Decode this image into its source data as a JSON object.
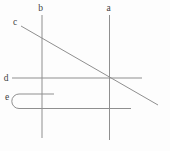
{
  "figure": {
    "width": 170,
    "height": 151,
    "background": "#fdfdfd",
    "stroke_color": "#8f8f8f",
    "stroke_width": 1,
    "label_color": "#3f3f3f",
    "elements": [
      {
        "id": "line-b",
        "label": "b",
        "type": "line",
        "x1": 42,
        "y1": 15,
        "x2": 42,
        "y2": 138,
        "label_x": 40.5,
        "label_y": 10.5
      },
      {
        "id": "line-a",
        "label": "a",
        "type": "line",
        "x1": 109.5,
        "y1": 15,
        "x2": 109.5,
        "y2": 140,
        "label_x": 108.5,
        "label_y": 11
      },
      {
        "id": "line-c",
        "label": "c",
        "type": "line",
        "x1": 21,
        "y1": 26,
        "x2": 158,
        "y2": 105,
        "label_x": 15,
        "label_y": 24.5
      },
      {
        "id": "line-d",
        "label": "d",
        "type": "line",
        "x1": 12,
        "y1": 78,
        "x2": 142,
        "y2": 78,
        "label_x": 6,
        "label_y": 81
      },
      {
        "id": "curve-e",
        "label": "e",
        "type": "path",
        "d": "M 54 94 L 19 94 A 7.2 7.25 0 0 0 19 108.5 L 131 108.5",
        "label_x": 7,
        "label_y": 99.5
      }
    ]
  }
}
